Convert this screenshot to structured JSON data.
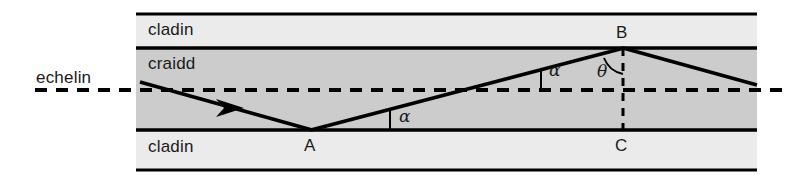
{
  "figure": {
    "type": "optical-fibre-ray-diagram",
    "title_text": "",
    "background_color": "#ffffff",
    "stroke_color": "#000000",
    "cladding_fill": "#ebebeb",
    "core_fill": "#cccccc",
    "labels": {
      "axis": "echelin",
      "cladding_top": "cladin",
      "core": "craidd",
      "cladding_bottom": "cladin",
      "point_a": "A",
      "point_b": "B",
      "point_c": "C",
      "angle_alpha_1": "α",
      "angle_alpha_2": "α",
      "angle_theta": "θ"
    },
    "label_positions": {
      "axis": {
        "x": 36,
        "y": 69
      },
      "cladding_top": {
        "x": 148,
        "y": 21
      },
      "core": {
        "x": 148,
        "y": 55
      },
      "cladding_bottom": {
        "x": 148,
        "y": 138
      },
      "point_a": {
        "x": 304,
        "y": 137
      },
      "point_b": {
        "x": 616,
        "y": 24
      },
      "point_c": {
        "x": 615,
        "y": 137
      },
      "angle_alpha_1": {
        "x": 399,
        "y": 108
      },
      "angle_alpha_2": {
        "x": 549,
        "y": 62
      },
      "angle_theta": {
        "x": 597,
        "y": 63
      }
    },
    "frame": {
      "left": 136,
      "right": 757,
      "line_top_y": 14,
      "line_core_top_y": 48,
      "line_core_bottom_y": 130,
      "line_bottom_y": 170,
      "line_width": 3
    },
    "axis_line": {
      "y": 90,
      "x_start": 35,
      "x_end": 783,
      "dash": "12 9",
      "width": 4
    },
    "rays": [
      {
        "name": "incoming-ray",
        "x1": 140,
        "y1": 82,
        "x2": 311,
        "y2": 130
      },
      {
        "name": "reflected-ray-a-to-b",
        "x1": 311,
        "y1": 130,
        "x2": 623,
        "y2": 48
      },
      {
        "name": "reflected-ray-b-outward",
        "x1": 623,
        "y1": 48,
        "x2": 757,
        "y2": 85
      }
    ],
    "arrowhead": {
      "x": 232,
      "y": 106
    },
    "vertical_dashed_bc": {
      "x": 623,
      "y_top": 48,
      "y_bottom": 130,
      "dash": "8 7",
      "width": 3
    },
    "angle_marks": [
      {
        "name": "alpha-at-a",
        "vertex_x": 311,
        "vertex_y": 130,
        "tick_x": 390,
        "tick_y_top": 109,
        "tick_y_bottom": 130
      },
      {
        "name": "alpha-on-axis",
        "vertex_x": 311,
        "vertex_y": 130,
        "tick_x": 540,
        "tick_y_top": 69,
        "tick_y_bottom": 90
      },
      {
        "name": "theta-at-b",
        "vertex_x": 623,
        "vertex_y": 48,
        "radius": 26
      }
    ]
  }
}
